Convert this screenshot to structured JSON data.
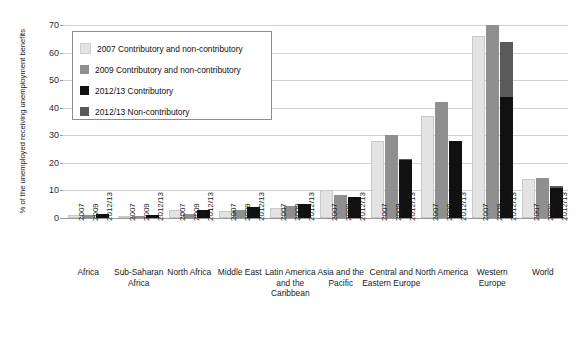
{
  "chart_data": {
    "type": "bar",
    "title": "",
    "subtitle": "",
    "xlabel": "",
    "ylabel": "% of the unemployed receiving unemployment benefits",
    "ylim": [
      0,
      70
    ],
    "yticks": [
      0,
      10,
      20,
      30,
      40,
      50,
      60,
      70
    ],
    "grid": true,
    "legend_position": "upper-left-inside",
    "stacked_note": "2012/13 column is stacked: Contributory (black) plus Non-contributory (dark grey)",
    "categories": [
      "Africa",
      "Sub-Saharan Africa",
      "North Africa",
      "Middle East",
      "Latin America and the Caribbean",
      "Asia and the Pacific",
      "Central and Eastern Europe",
      "North America",
      "Western Europe",
      "World"
    ],
    "period_labels": [
      "2007",
      "2009",
      "2012/13"
    ],
    "series": [
      {
        "name": "2007 Contributory and non-contributory",
        "color": "#e3e3e3",
        "values": [
          1.0,
          0.8,
          3.0,
          2.5,
          3.5,
          10.0,
          28.0,
          37.0,
          66.0,
          14.0
        ]
      },
      {
        "name": "2009 Contributory and non-contributory",
        "color": "#8f8f8f",
        "values": [
          1.0,
          0.8,
          1.5,
          3.0,
          4.5,
          8.5,
          30.0,
          42.0,
          70.0,
          14.5
        ]
      },
      {
        "name": "2012/13 Contributory",
        "color": "#111111",
        "values": [
          1.5,
          1.2,
          3.0,
          4.0,
          5.0,
          7.5,
          21.0,
          28.0,
          44.0,
          11.0
        ]
      },
      {
        "name": "2012/13 Non-contributory",
        "color": "#5a5a5a",
        "values": [
          0.0,
          0.0,
          0.0,
          0.0,
          0.0,
          0.0,
          0.5,
          0.0,
          20.0,
          0.5
        ]
      }
    ]
  },
  "legend": {
    "items": [
      {
        "label": "2007 Contributory and non-contributory",
        "color": "#e3e3e3"
      },
      {
        "label": "2009 Contributory and non-contributory",
        "color": "#8f8f8f"
      },
      {
        "label": "2012/13 Contributory",
        "color": "#111111"
      },
      {
        "label": "2012/13 Non-contributory",
        "color": "#5a5a5a"
      }
    ]
  },
  "axis": {
    "y_title": "% of the unemployed receiving unemployment benefits",
    "y_tick_labels": [
      "0",
      "10",
      "20",
      "30",
      "40",
      "50",
      "60",
      "70"
    ]
  }
}
